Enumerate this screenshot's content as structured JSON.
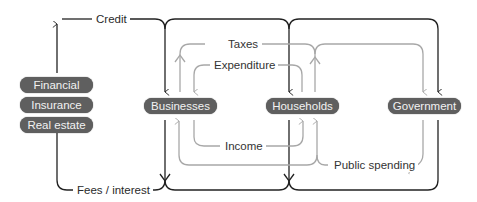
{
  "colors": {
    "dark_flow": "#222222",
    "light_flow": "#a8a8a8",
    "node_fill": "#5f5f5f",
    "node_text": "#f2f2f2",
    "background": "#ffffff"
  },
  "nodes": {
    "financial_stack": [
      {
        "label": "Financial"
      },
      {
        "label": "Insurance"
      },
      {
        "label": "Real estate"
      }
    ],
    "businesses": {
      "label": "Businesses"
    },
    "households": {
      "label": "Households"
    },
    "government": {
      "label": "Government"
    }
  },
  "flows": {
    "credit": {
      "label": "Credit",
      "style": "dark"
    },
    "fees_interest": {
      "label": "Fees / interest",
      "style": "dark"
    },
    "taxes": {
      "label": "Taxes",
      "style": "light"
    },
    "expenditure": {
      "label": "Expenditure",
      "style": "light"
    },
    "income": {
      "label": "Income",
      "style": "light"
    },
    "public_spending": {
      "label": "Public spending",
      "style": "light"
    }
  }
}
